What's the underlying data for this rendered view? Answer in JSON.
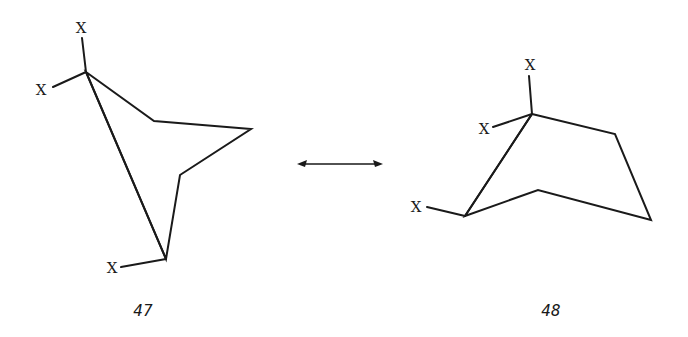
{
  "diagram": {
    "type": "chemical-conformation-equilibrium",
    "arrow": "equilibrium-double-headed",
    "structures": [
      {
        "id": "left",
        "label": "47",
        "substituent_labels": [
          "X",
          "X",
          "X"
        ],
        "ring_vertices": [
          [
            86,
            72
          ],
          [
            154,
            121
          ],
          [
            251,
            129
          ],
          [
            180,
            175
          ],
          [
            166,
            259
          ]
        ],
        "bridge_bond": [
          [
            86,
            72
          ],
          [
            166,
            259
          ]
        ],
        "substituent_bonds": [
          {
            "from": [
              86,
              72
            ],
            "to": [
              82,
              38
            ],
            "label_pos": [
              81,
              33
            ],
            "label": "X"
          },
          {
            "from": [
              86,
              72
            ],
            "to": [
              53,
              87
            ],
            "label_pos": [
              41,
              95
            ],
            "label": "X"
          },
          {
            "from": [
              166,
              259
            ],
            "to": [
              121,
              267
            ],
            "label_pos": [
              112,
              273
            ],
            "label": "X"
          }
        ],
        "label_pos": [
          143,
          316
        ]
      },
      {
        "id": "right",
        "label": "48",
        "substituent_labels": [
          "X",
          "X",
          "X"
        ],
        "ring_vertices": [
          [
            532,
            114
          ],
          [
            615,
            134
          ],
          [
            651,
            220
          ],
          [
            538,
            190
          ],
          [
            465,
            216
          ]
        ],
        "bridge_bond": [
          [
            532,
            114
          ],
          [
            465,
            216
          ]
        ],
        "substituent_bonds": [
          {
            "from": [
              532,
              114
            ],
            "to": [
              529,
              76
            ],
            "label_pos": [
              530,
              70
            ],
            "label": "X"
          },
          {
            "from": [
              532,
              114
            ],
            "to": [
              493,
              127
            ],
            "label_pos": [
              484,
              134
            ],
            "label": "X"
          },
          {
            "from": [
              465,
              216
            ],
            "to": [
              427,
              207
            ],
            "label_pos": [
              416,
              212
            ],
            "label": "X"
          }
        ],
        "label_pos": [
          551,
          316
        ]
      }
    ],
    "colors": {
      "ink": "#1a1a1a",
      "background": "#ffffff"
    }
  }
}
